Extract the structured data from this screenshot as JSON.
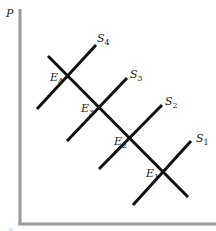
{
  "diagram": {
    "type": "supply-demand-shift",
    "axes": {
      "y_label": "P",
      "origin_label": "0",
      "color": "#999999"
    },
    "demand_curve": {
      "from": [
        48,
        56
      ],
      "to": [
        188,
        197
      ],
      "color": "#111111"
    },
    "supply_curves": [
      {
        "name": "S",
        "sub": "4",
        "from": [
          37,
          109
        ],
        "to": [
          96,
          45
        ],
        "label_pos": [
          96,
          40
        ]
      },
      {
        "name": "S",
        "sub": "3",
        "from": [
          67,
          141
        ],
        "to": [
          127,
          78
        ],
        "label_pos": [
          128,
          76
        ]
      },
      {
        "name": "S",
        "sub": "2",
        "from": [
          99,
          169
        ],
        "to": [
          162,
          105
        ],
        "label_pos": [
          163,
          104
        ]
      },
      {
        "name": "S",
        "sub": "1",
        "from": [
          133,
          205
        ],
        "to": [
          191,
          141
        ],
        "label_pos": [
          194,
          140
        ]
      }
    ],
    "equilibria": [
      {
        "name": "E",
        "sub": "4",
        "point": [
          68,
          76
        ],
        "label_pos": [
          46,
          84
        ]
      },
      {
        "name": "E",
        "sub": "3",
        "point": [
          99,
          106
        ],
        "label_pos": [
          77,
          114
        ]
      },
      {
        "name": "E",
        "sub": "2",
        "point": [
          133,
          143
        ],
        "label_pos": [
          111,
          151
        ]
      },
      {
        "name": "E",
        "sub": "1",
        "point": [
          165,
          174
        ],
        "label_pos": [
          143,
          182
        ]
      }
    ]
  },
  "labels": {
    "y_axis": "P",
    "origin": "0",
    "s4": "S",
    "s4_sub": "4",
    "s3": "S",
    "s3_sub": "3",
    "s2": "S",
    "s2_sub": "2",
    "s1": "S",
    "s1_sub": "1",
    "e4": "E",
    "e4_sub": "4",
    "e3": "E",
    "e3_sub": "3",
    "e2": "E",
    "e2_sub": "2",
    "e1": "E",
    "e1_sub": "1"
  }
}
